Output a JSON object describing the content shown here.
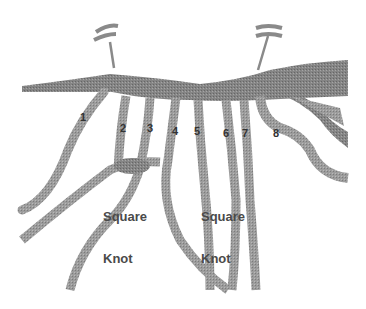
{
  "diagram": {
    "colors": {
      "background": "#ffffff",
      "cord": "#9a9a9a",
      "cord_dark": "#7a7a7a",
      "pin": "#8a8a8a",
      "label": "#333333"
    },
    "cord_labels": [
      {
        "id": "1",
        "text": "1"
      },
      {
        "id": "2",
        "text": "2"
      },
      {
        "id": "3",
        "text": "3"
      },
      {
        "id": "4",
        "text": "4"
      },
      {
        "id": "5",
        "text": "5"
      },
      {
        "id": "6",
        "text": "6"
      },
      {
        "id": "7",
        "text": "7"
      },
      {
        "id": "8",
        "text": "8"
      }
    ],
    "knot_labels": [
      {
        "line1": "Square",
        "line2": "Knot"
      },
      {
        "line1": "Square",
        "line2": "Knot"
      }
    ],
    "pins": [
      "left-pin",
      "right-pin"
    ]
  }
}
